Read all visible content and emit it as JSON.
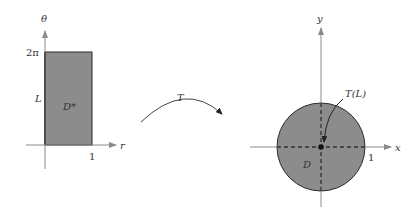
{
  "colors": {
    "axis": "#8a8a8a",
    "region_fill": "#8c8c8c",
    "region_stroke": "#2a2a2a",
    "dashed": "#333333",
    "text": "#333333",
    "arrow": "#444444"
  },
  "left_plot": {
    "horizontal_axis_label": "r",
    "vertical_axis_label": "θ",
    "y_tick_label": "2π",
    "x_tick_label": "1",
    "edge_label": "L",
    "region_label": "D*"
  },
  "transform": {
    "label": "T"
  },
  "right_plot": {
    "horizontal_axis_label": "x",
    "vertical_axis_label": "y",
    "x_tick_label": "1",
    "image_label": "T(L)",
    "region_label": "D"
  }
}
